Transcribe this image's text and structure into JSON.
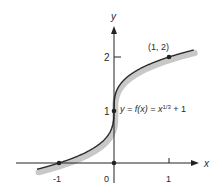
{
  "chart_data": {
    "type": "line",
    "title": "",
    "function_label": "y = f(x) = x^(1/3) + 1",
    "function_label_parts": {
      "lhs": "y = f(x) = x",
      "exponent": "1/3",
      "rhs": " + 1"
    },
    "xlabel": "x",
    "ylabel": "y",
    "x_ticks": [
      "-1",
      "0",
      "1"
    ],
    "y_ticks": [
      "1",
      "2"
    ],
    "xlim": [
      -1.4,
      1.5
    ],
    "ylim": [
      0,
      2.8
    ],
    "points": [
      {
        "x": -1,
        "y": 0
      },
      {
        "x": 0,
        "y": 0
      },
      {
        "x": 0,
        "y": 1
      },
      {
        "x": 1,
        "y": 2
      }
    ],
    "point_label": "(1, 2)",
    "series": [
      {
        "name": "f(x) = x^(1/3) + 1",
        "x": [
          -1.35,
          -1,
          -0.5,
          -0.1,
          0,
          0.1,
          0.5,
          1,
          1.4
        ],
        "values": [
          -0.105,
          0,
          0.206,
          0.536,
          1,
          1.464,
          1.794,
          2,
          2.119
        ]
      }
    ],
    "colors": {
      "curve": "#2b2b2b",
      "shading": "#c8c8c8",
      "axis": "#222222"
    }
  }
}
